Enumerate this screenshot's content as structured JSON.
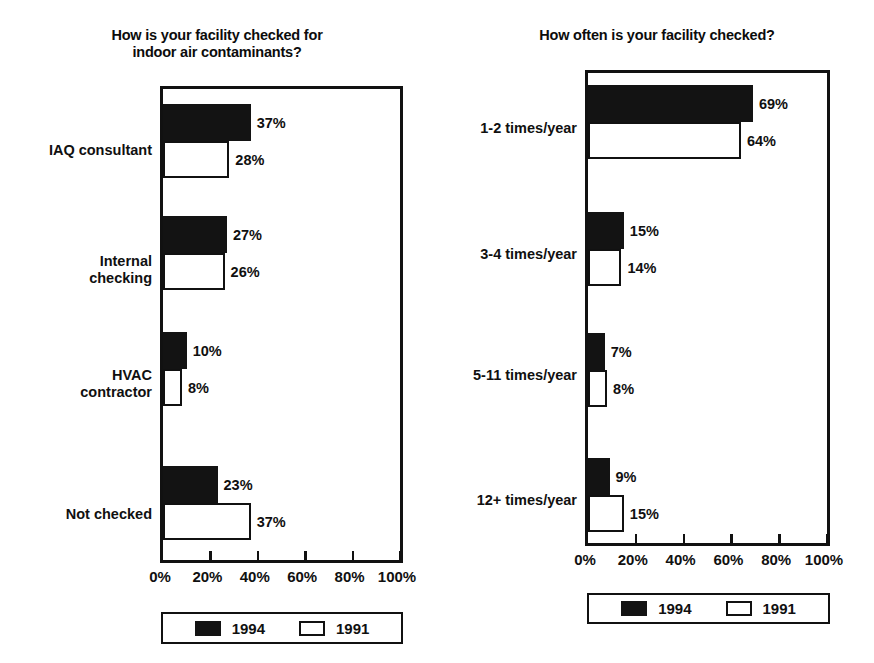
{
  "chart_data": [
    {
      "type": "bar",
      "orientation": "horizontal",
      "title": "How is your facility checked for\nindoor air contaminants?",
      "xlabel": "",
      "ylabel": "",
      "xlim": [
        0,
        100
      ],
      "xticks": [
        0,
        20,
        40,
        60,
        80,
        100
      ],
      "xticklabels": [
        "0%",
        "20%",
        "40%",
        "60%",
        "80%",
        "100%"
      ],
      "grid": false,
      "legend_position": "below-axes",
      "categories": [
        "IAQ consultant",
        "Internal\nchecking",
        "HVAC\ncontractor",
        "Not checked"
      ],
      "series": [
        {
          "name": "1994",
          "color": "#131313",
          "values": [
            37,
            27,
            10,
            23
          ],
          "labels": [
            "37%",
            "27%",
            "10%",
            "23%"
          ]
        },
        {
          "name": "1991",
          "color": "#ffffff",
          "values": [
            28,
            26,
            8,
            37
          ],
          "labels": [
            "28%",
            "26%",
            "8%",
            "37%"
          ]
        }
      ]
    },
    {
      "type": "bar",
      "orientation": "horizontal",
      "title": "How often is your facility checked?",
      "xlabel": "",
      "ylabel": "",
      "xlim": [
        0,
        100
      ],
      "xticks": [
        0,
        20,
        40,
        60,
        80,
        100
      ],
      "xticklabels": [
        "0%",
        "20%",
        "40%",
        "60%",
        "80%",
        "100%"
      ],
      "grid": false,
      "legend_position": "below-axes",
      "categories": [
        "1-2 times/year",
        "3-4 times/year",
        "5-11 times/year",
        "12+ times/year"
      ],
      "series": [
        {
          "name": "1994",
          "color": "#131313",
          "values": [
            69,
            15,
            7,
            9
          ],
          "labels": [
            "69%",
            "15%",
            "7%",
            "9%"
          ]
        },
        {
          "name": "1991",
          "color": "#ffffff",
          "values": [
            64,
            14,
            8,
            15
          ],
          "labels": [
            "64%",
            "14%",
            "8%",
            "15%"
          ]
        }
      ]
    }
  ],
  "left": {
    "title": "How is your facility checked for\nindoor air contaminants?",
    "categories": [
      "IAQ consultant",
      "Internal\nchecking",
      "HVAC\ncontractor",
      "Not checked"
    ],
    "values_1994": [
      "37%",
      "27%",
      "10%",
      "23%"
    ],
    "values_1991": [
      "28%",
      "26%",
      "8%",
      "37%"
    ],
    "xticklabels": [
      "0%",
      "20%",
      "40%",
      "60%",
      "80%",
      "100%"
    ],
    "legend": {
      "dark_label": "1994",
      "light_label": "1991"
    }
  },
  "right": {
    "title": "How often is your facility checked?",
    "categories": [
      "1-2 times/year",
      "3-4 times/year",
      "5-11 times/year",
      "12+ times/year"
    ],
    "values_1994": [
      "69%",
      "15%",
      "7%",
      "9%"
    ],
    "values_1991": [
      "64%",
      "14%",
      "8%",
      "15%"
    ],
    "xticklabels": [
      "0%",
      "20%",
      "40%",
      "60%",
      "80%",
      "100%"
    ],
    "legend": {
      "dark_label": "1994",
      "light_label": "1991"
    }
  },
  "colors": {
    "series_1994": "#131313",
    "series_1991": "#ffffff",
    "ink": "#111111",
    "background": "#ffffff"
  }
}
